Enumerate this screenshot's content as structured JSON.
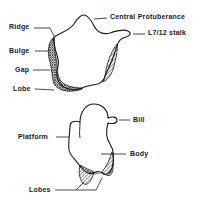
{
  "diagram": {
    "top_view": {
      "labels": {
        "ridge": "Ridge",
        "bulge": "Bulge",
        "gap": "Gap",
        "lobe": "Lobe",
        "central_protuberance": "Central Protuberance",
        "stalk": "L7/12 stalk"
      }
    },
    "bottom_view": {
      "labels": {
        "bill": "Bill",
        "platform": "Platform",
        "body": "Body",
        "lobes": "Lobes"
      }
    }
  },
  "colors": {
    "ink": "#1a1a1a",
    "background": "#ffffff"
  }
}
